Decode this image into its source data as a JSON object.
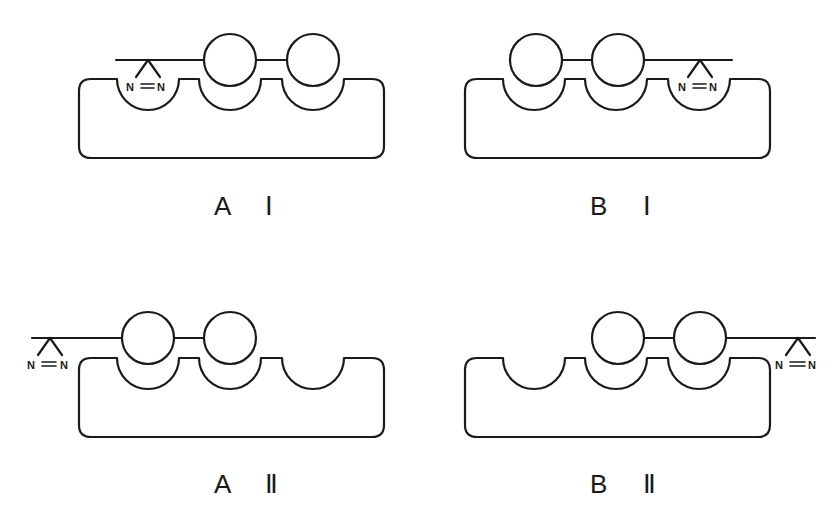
{
  "figure": {
    "panels": [
      {
        "id": "AI",
        "label": "A Ⅰ",
        "diazirine_position": "left-pocket",
        "circles_in_pockets": [
          2,
          3
        ],
        "empty_pockets": []
      },
      {
        "id": "BI",
        "label": "B Ⅰ",
        "diazirine_position": "right-pocket",
        "circles_in_pockets": [
          1,
          2
        ],
        "empty_pockets": []
      },
      {
        "id": "AII",
        "label": "A Ⅱ",
        "diazirine_position": "outside-left",
        "circles_in_pockets": [
          1,
          2
        ],
        "empty_pockets": [
          3
        ]
      },
      {
        "id": "BII",
        "label": "B Ⅱ",
        "diazirine_position": "outside-right",
        "circles_in_pockets": [
          2,
          3
        ],
        "empty_pockets": [
          1
        ]
      }
    ],
    "diazirine": {
      "atom_left": "N",
      "atom_right": "N",
      "bond": "="
    }
  }
}
